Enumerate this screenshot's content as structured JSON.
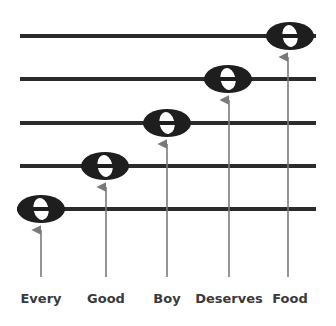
{
  "colors": {
    "staff_line": "#2b2b2b",
    "note": "#1e1e1e",
    "arrow": "#7a7a7a",
    "label": "#3a3a3a",
    "background": "#ffffff"
  },
  "staff": {
    "lines_y": [
      36,
      79,
      123,
      166,
      209
    ],
    "x_start": 20,
    "x_end": 316
  },
  "notes": [
    {
      "word": "Every",
      "cx": 41,
      "cy": 209,
      "label_x": 41
    },
    {
      "word": "Good",
      "cx": 105,
      "cy": 166,
      "label_x": 106
    },
    {
      "word": "Boy",
      "cx": 167,
      "cy": 123,
      "label_x": 167
    },
    {
      "word": "Deserves",
      "cx": 228,
      "cy": 79,
      "label_x": 229
    },
    {
      "word": "Food",
      "cx": 288,
      "cy": 36,
      "label_x": 288
    }
  ],
  "labels": {
    "every": "Every",
    "good": "Good",
    "boy": "Boy",
    "deserves": "Deserves",
    "food": "Food"
  }
}
